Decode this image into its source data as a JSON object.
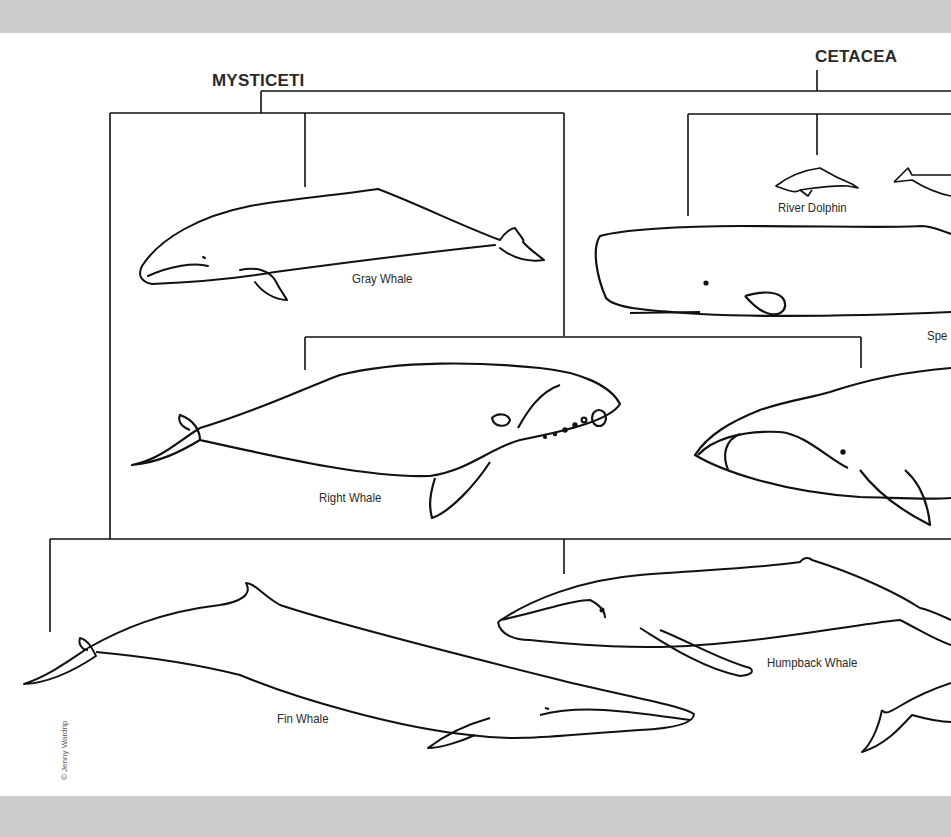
{
  "diagram": {
    "root": {
      "label": "CETACEA"
    },
    "suborders": [
      {
        "label": "MYSTICETI"
      }
    ],
    "species": [
      {
        "id": "gray",
        "label": "Gray Whale"
      },
      {
        "id": "river-dolphin",
        "label": "River Dolphin"
      },
      {
        "id": "sperm",
        "label": "Spe"
      },
      {
        "id": "right",
        "label": "Right Whale"
      },
      {
        "id": "humpback",
        "label": "Humpback Whale"
      },
      {
        "id": "fin",
        "label": "Fin Whale"
      }
    ],
    "credit": "© Jenny Wardrip"
  },
  "colors": {
    "band": "#cbcbcb",
    "paper": "#ffffff",
    "ink": "#111111"
  }
}
